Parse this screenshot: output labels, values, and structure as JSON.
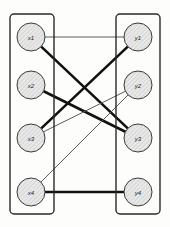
{
  "diagram": {
    "type": "bipartite-graph",
    "background_color": "#fdfdfc",
    "groups": [
      {
        "id": "left-group",
        "name": "x-vertices",
        "box": {
          "x": 10,
          "y": 14,
          "w": 44,
          "h": 200,
          "stroke": "#2a2a2a"
        },
        "nodes": [
          {
            "id": "x1",
            "label": "x1",
            "cx": 31,
            "cy": 37,
            "r": 14
          },
          {
            "id": "x2",
            "label": "x2",
            "cx": 31,
            "cy": 85,
            "r": 14
          },
          {
            "id": "x3",
            "label": "x3",
            "cx": 31,
            "cy": 138,
            "r": 14
          },
          {
            "id": "x4",
            "label": "x4",
            "cx": 31,
            "cy": 192,
            "r": 14
          }
        ]
      },
      {
        "id": "right-group",
        "name": "y-vertices",
        "box": {
          "x": 116,
          "y": 14,
          "w": 44,
          "h": 200,
          "stroke": "#2a2a2a"
        },
        "nodes": [
          {
            "id": "y1",
            "label": "y1",
            "cx": 138,
            "cy": 37,
            "r": 14
          },
          {
            "id": "y2",
            "label": "y2",
            "cx": 138,
            "cy": 85,
            "r": 14
          },
          {
            "id": "y3",
            "label": "y3",
            "cx": 138,
            "cy": 138,
            "r": 14
          },
          {
            "id": "y4",
            "label": "y4",
            "cx": 138,
            "cy": 192,
            "r": 14
          }
        ]
      }
    ],
    "node_style": {
      "fill": "#e8e8e8",
      "stroke": "#3a3a3a",
      "stroke_width": 1,
      "hatch": true
    },
    "edges": [
      {
        "id": "e-x1-y1",
        "from": "x1",
        "to": "y1",
        "weight": "thin",
        "width": 1,
        "color": "#5a5a5a"
      },
      {
        "id": "e-x1-y3",
        "from": "x1",
        "to": "y3",
        "weight": "thick",
        "width": 2.6,
        "color": "#111111"
      },
      {
        "id": "e-x2-y3",
        "from": "x2",
        "to": "y3",
        "weight": "thick",
        "width": 2.6,
        "color": "#111111"
      },
      {
        "id": "e-x3-y1",
        "from": "x3",
        "to": "y1",
        "weight": "thick",
        "width": 2.6,
        "color": "#111111"
      },
      {
        "id": "e-x3-y2",
        "from": "x3",
        "to": "y2",
        "weight": "thin",
        "width": 1,
        "color": "#5a5a5a"
      },
      {
        "id": "e-x4-y2",
        "from": "x4",
        "to": "y2",
        "weight": "thin",
        "width": 1,
        "color": "#5a5a5a"
      },
      {
        "id": "e-x4-y4",
        "from": "x4",
        "to": "y4",
        "weight": "thick",
        "width": 2.6,
        "color": "#111111"
      }
    ]
  }
}
